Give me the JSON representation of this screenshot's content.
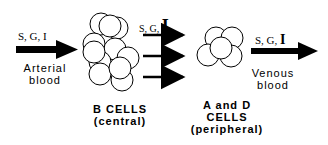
{
  "diagram": {
    "inflow": {
      "label_prefix": "S, G, ",
      "label_big": "I",
      "caption_line1": "Arterial",
      "caption_line2": "blood"
    },
    "middle_flow": {
      "label_prefix": "S, G, ",
      "label_big": "I"
    },
    "outflow": {
      "label_prefix": "S, G, ",
      "label_big": "I",
      "caption_line1": "Venous",
      "caption_line2": "blood"
    },
    "b_cells": {
      "line1": "B  CELLS",
      "line2": "(central)"
    },
    "ad_cells": {
      "line1": "A and D",
      "line2": "CELLS",
      "line3": "(peripheral)"
    }
  }
}
